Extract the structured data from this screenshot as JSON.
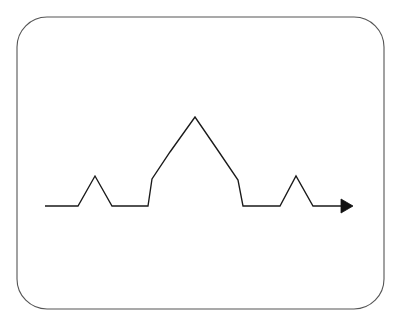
{
  "figure": {
    "kind": "line-diagram",
    "background_color": "#ffffff",
    "canvas": {
      "width": 395,
      "height": 325
    },
    "frame": {
      "name": "rounded-rectangle-border",
      "x": 17,
      "y": 17,
      "width": 367,
      "height": 292,
      "corner_radius": 30,
      "stroke_color": "#555555",
      "stroke_width": 1.1,
      "fill": "none"
    },
    "curve": {
      "name": "koch-curve",
      "iteration": 2,
      "segments": 16,
      "stroke_color": "#1a1a1a",
      "stroke_width": 1.35,
      "baseline_y": 206,
      "start_x": 45,
      "end_x": 344,
      "points": [
        [
          45,
          206
        ],
        [
          78,
          206
        ],
        [
          95,
          176
        ],
        [
          112,
          206
        ],
        [
          148,
          206
        ],
        [
          152,
          179
        ],
        [
          170,
          152
        ],
        [
          195,
          117
        ],
        [
          219,
          152
        ],
        [
          238,
          180
        ],
        [
          243,
          206
        ],
        [
          280,
          206
        ],
        [
          296,
          176
        ],
        [
          313,
          206
        ],
        [
          344,
          206
        ]
      ]
    },
    "arrow": {
      "name": "arrow-head-terminator",
      "tip_x": 353,
      "tip_y": 206,
      "back_x": 341,
      "half_height": 7,
      "fill_color": "#111111",
      "direction": "right"
    }
  }
}
